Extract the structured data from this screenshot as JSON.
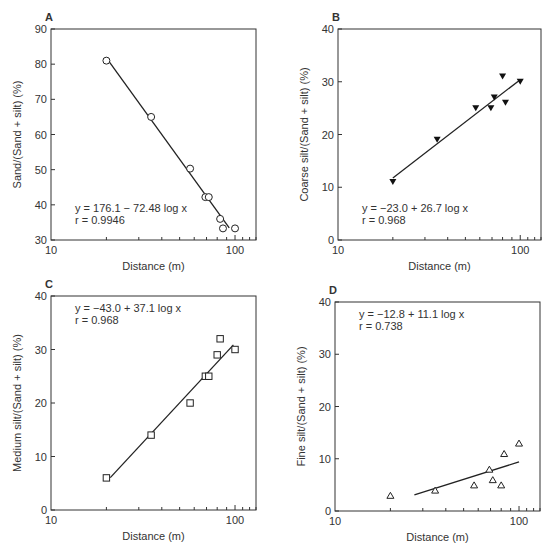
{
  "chart_data": [
    {
      "panel": "A",
      "type": "scatter",
      "title": "A",
      "xlabel": "Distance (m)",
      "ylabel": "Sand/(Sand + silt) (%)",
      "xscale": "log",
      "xlim": [
        10,
        130
      ],
      "ylim": [
        30,
        90
      ],
      "xticks": [
        10,
        100
      ],
      "yticks": [
        30,
        40,
        50,
        60,
        70,
        80,
        90
      ],
      "marker": "open-circle",
      "x": [
        20,
        35,
        57,
        69,
        72,
        83,
        86,
        100
      ],
      "y": [
        81,
        65,
        50.3,
        42.2,
        42.2,
        36,
        33.3,
        33.3
      ],
      "fit": {
        "x0": 20,
        "x1": 93,
        "equation": "y = 176.1 − 72.48 log x",
        "r": "r = 0.9946"
      },
      "annotation_pos": "bottom-left"
    },
    {
      "panel": "B",
      "type": "scatter",
      "title": "B",
      "xlabel": "Distance (m)",
      "ylabel": "Coarse silt/(Sand + silt) (%)",
      "xscale": "log",
      "xlim": [
        10,
        130
      ],
      "ylim": [
        0,
        40
      ],
      "xticks": [
        10,
        100
      ],
      "yticks": [
        0,
        10,
        20,
        30,
        40
      ],
      "marker": "filled-down-triangle",
      "x": [
        20,
        35,
        57,
        69,
        72,
        80,
        83,
        100
      ],
      "y": [
        11,
        19,
        25,
        25,
        27,
        31,
        26,
        30
      ],
      "fit": {
        "x0": 20,
        "x1": 100,
        "equation": "y = −23.0 + 26.7 log x",
        "r": "r = 0.968"
      },
      "annotation_pos": "bottom-left"
    },
    {
      "panel": "C",
      "type": "scatter",
      "title": "C",
      "xlabel": "Distance (m)",
      "ylabel": "Medium silt/(Sand + silt) (%)",
      "xscale": "log",
      "xlim": [
        10,
        130
      ],
      "ylim": [
        0,
        40
      ],
      "xticks": [
        10,
        100
      ],
      "yticks": [
        0,
        10,
        20,
        30,
        40
      ],
      "marker": "open-square",
      "x": [
        20,
        35,
        57,
        69,
        72,
        80,
        83,
        100
      ],
      "y": [
        6,
        14,
        20,
        25,
        25,
        29,
        32,
        30
      ],
      "fit": {
        "x0": 21,
        "x1": 98,
        "equation": "y = −43.0 + 37.1 log x",
        "r": "r = 0.968"
      },
      "annotation_pos": "top-left"
    },
    {
      "panel": "D",
      "type": "scatter",
      "title": "D",
      "xlabel": "Distance (m)",
      "ylabel": "Fine silt/(Sand + silt) (%)",
      "xscale": "log",
      "xlim": [
        10,
        130
      ],
      "ylim": [
        0,
        40
      ],
      "xticks": [
        10,
        100
      ],
      "yticks": [
        0,
        10,
        20,
        30,
        40
      ],
      "marker": "open-up-triangle",
      "x": [
        20,
        35,
        57,
        69,
        72,
        80,
        83,
        100
      ],
      "y": [
        3,
        4,
        5,
        8,
        6,
        5,
        11,
        13
      ],
      "fit": {
        "x0": 27,
        "x1": 100,
        "equation": "y = −12.8 + 11.1 log x",
        "r": "r = 0.738"
      },
      "annotation_pos": "top-left"
    }
  ]
}
